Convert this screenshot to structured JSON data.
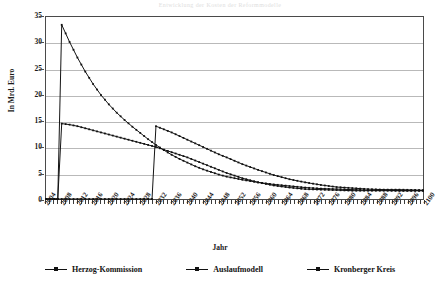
{
  "chart_data": {
    "type": "line",
    "title": "Entwicklung der Kosten der Reformmodelle",
    "xlabel": "Jahr",
    "ylabel": "In Mrd. Euro",
    "ylim": [
      0,
      35
    ],
    "yticks": [
      0,
      5,
      10,
      15,
      20,
      25,
      30,
      35
    ],
    "xlim": [
      2004,
      2100
    ],
    "xticks": [
      2004,
      2008,
      2012,
      2016,
      2020,
      2024,
      2028,
      2032,
      2036,
      2040,
      2044,
      2048,
      2052,
      2056,
      2060,
      2064,
      2068,
      2072,
      2076,
      2080,
      2084,
      2088,
      2092,
      2096,
      2100
    ],
    "grid": true,
    "legend_position": "bottom",
    "series": [
      {
        "name": "Herzog-Kommission",
        "color": "#111111",
        "x": [
          2004,
          2006,
          2007,
          2008,
          2010,
          2012,
          2014,
          2016,
          2018,
          2020,
          2022,
          2024,
          2026,
          2028,
          2030,
          2032,
          2034,
          2036,
          2038,
          2040,
          2042,
          2044,
          2046,
          2048,
          2050,
          2054,
          2058,
          2062,
          2066,
          2070,
          2074,
          2078,
          2082,
          2086,
          2090,
          2094,
          2100
        ],
        "values": [
          0,
          0,
          0,
          33.5,
          30.2,
          27.2,
          24.5,
          22.1,
          20.0,
          18.2,
          16.6,
          15.2,
          13.9,
          12.7,
          11.5,
          10.4,
          9.4,
          8.5,
          7.7,
          7.0,
          6.3,
          5.7,
          5.2,
          4.7,
          4.3,
          3.7,
          3.2,
          2.8,
          2.5,
          2.2,
          2.0,
          1.9,
          1.8,
          1.7,
          1.7,
          1.6,
          1.6
        ]
      },
      {
        "name": "Auslaufmodell",
        "color": "#111111",
        "x": [
          2004,
          2006,
          2007,
          2008,
          2010,
          2012,
          2014,
          2016,
          2018,
          2020,
          2022,
          2024,
          2026,
          2028,
          2030,
          2032,
          2034,
          2036,
          2038,
          2040,
          2042,
          2044,
          2046,
          2048,
          2050,
          2054,
          2058,
          2062,
          2066,
          2070,
          2074,
          2078,
          2082,
          2086,
          2090,
          2094,
          2100
        ],
        "values": [
          0,
          0,
          0,
          14.5,
          14.3,
          14.0,
          13.6,
          13.2,
          12.8,
          12.4,
          12.0,
          11.6,
          11.2,
          10.8,
          10.4,
          10.0,
          9.5,
          9.0,
          8.5,
          8.0,
          7.4,
          6.8,
          6.2,
          5.6,
          5.0,
          4.0,
          3.2,
          2.6,
          2.2,
          1.9,
          1.8,
          1.7,
          1.6,
          1.6,
          1.6,
          1.6,
          1.6
        ]
      },
      {
        "name": "Kronberger Kreis",
        "color": "#111111",
        "x": [
          2004,
          2008,
          2012,
          2016,
          2020,
          2024,
          2028,
          2030,
          2031,
          2032,
          2034,
          2036,
          2038,
          2040,
          2042,
          2044,
          2046,
          2048,
          2050,
          2054,
          2058,
          2062,
          2066,
          2070,
          2074,
          2078,
          2082,
          2086,
          2090,
          2094,
          2100
        ],
        "values": [
          0,
          0,
          0,
          0,
          0,
          0,
          0,
          0,
          0,
          14.0,
          13.4,
          12.8,
          12.1,
          11.4,
          10.7,
          10.0,
          9.3,
          8.6,
          8.0,
          6.7,
          5.6,
          4.6,
          3.8,
          3.2,
          2.7,
          2.3,
          2.1,
          1.9,
          1.8,
          1.8,
          1.7
        ]
      }
    ]
  }
}
